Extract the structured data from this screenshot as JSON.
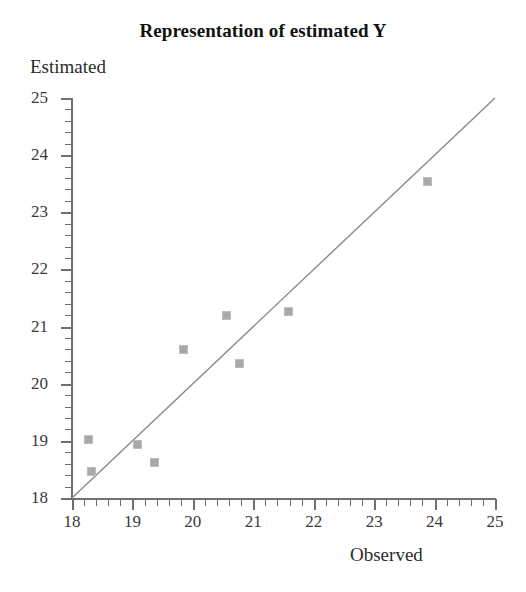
{
  "chart_data": {
    "type": "scatter",
    "title": "Representation of estimated Y",
    "xlabel": "Observed",
    "ylabel": "Estimated",
    "xlim": [
      18,
      25
    ],
    "ylim": [
      18,
      25
    ],
    "grid": false,
    "legend": "none",
    "x_ticks": [
      18,
      19,
      20,
      21,
      22,
      23,
      24,
      25
    ],
    "y_ticks": [
      18,
      19,
      20,
      21,
      22,
      23,
      24,
      25
    ],
    "x_tick_labels": [
      "18",
      "19",
      "20",
      "21",
      "22",
      "23",
      "24",
      "25"
    ],
    "y_tick_labels": [
      "18",
      "19",
      "20",
      "21",
      "22",
      "23",
      "24",
      "25"
    ],
    "minor_tick_step": 0.2,
    "point_color": "#a8a8a8",
    "line_color": "#8a8a8a",
    "axis_color": "#6f6f6f",
    "series": [
      {
        "name": "Estimated vs Observed",
        "points": [
          {
            "x": 18.28,
            "y": 19.02
          },
          {
            "x": 18.33,
            "y": 18.46
          },
          {
            "x": 19.09,
            "y": 18.94
          },
          {
            "x": 19.37,
            "y": 18.62
          },
          {
            "x": 19.84,
            "y": 20.6
          },
          {
            "x": 20.55,
            "y": 21.19
          },
          {
            "x": 20.77,
            "y": 20.35
          },
          {
            "x": 21.59,
            "y": 21.27
          },
          {
            "x": 23.88,
            "y": 23.54
          }
        ]
      }
    ],
    "trend_line": {
      "name": "identity line",
      "x0": 18,
      "y0": 18,
      "x1": 25,
      "y1": 25
    }
  }
}
